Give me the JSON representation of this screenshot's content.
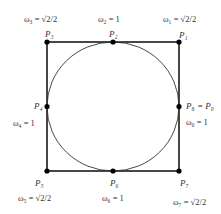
{
  "diagram": {
    "type": "circle inscribed in square with control points",
    "colors": {
      "stroke": "#1a1a1a",
      "point": "#000000",
      "background": "#ffffff"
    },
    "points": [
      {
        "id": "P1",
        "label": "P₁",
        "weight_label": "ω₁ = √2/2"
      },
      {
        "id": "P2",
        "label": "P₂",
        "weight_label": "ω₂ = 1"
      },
      {
        "id": "P3",
        "label": "P₃",
        "weight_label": "ω₃ = √2/2"
      },
      {
        "id": "P4",
        "label": "P₄",
        "weight_label": "ω₄ = 1"
      },
      {
        "id": "P5",
        "label": "P₅",
        "weight_label": "ω₅ = √2/2"
      },
      {
        "id": "P6",
        "label": "P₆",
        "weight_label": "ω₆ = 1"
      },
      {
        "id": "P7",
        "label": "P₇",
        "weight_label": "ω₇ = √2/2"
      },
      {
        "id": "P8",
        "label": "P₈ = P₀",
        "weight_label": "ω₀ = 1"
      }
    ]
  }
}
